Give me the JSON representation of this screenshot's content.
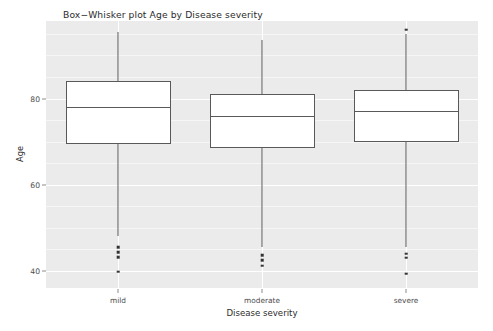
{
  "chart_data": {
    "type": "box",
    "title": "Box−Whisker plot Age by Disease severity",
    "xlabel": "Disease severity",
    "ylabel": "Age",
    "categories": [
      "mild",
      "moderate",
      "severe"
    ],
    "ylim": [
      36,
      98
    ],
    "yticks": [
      80,
      60,
      40
    ],
    "ytick_labels": [
      "80",
      "60",
      "40"
    ],
    "grid": true,
    "grid_color": "#ffffff",
    "panel_background": "#ebebeb",
    "legend": null,
    "box_fill": "#ffffff",
    "box_line_color": "#595959",
    "boxes": [
      {
        "category": "mild",
        "whisker_low": 48.0,
        "q1": 69.5,
        "median": 78.0,
        "q3": 84.0,
        "whisker_high": 95.5,
        "outliers": [
          45.5,
          44.3,
          43.1,
          39.8
        ]
      },
      {
        "category": "moderate",
        "whisker_low": 45.5,
        "q1": 68.5,
        "median": 76.0,
        "q3": 81.0,
        "whisker_high": 93.5,
        "outliers": [
          43.6,
          42.4,
          41.2
        ]
      },
      {
        "category": "severe",
        "whisker_low": 45.5,
        "q1": 70.0,
        "median": 77.0,
        "q3": 82.0,
        "whisker_high": 95.0,
        "outliers": [
          96.0,
          44.0,
          43.0,
          39.3
        ]
      }
    ]
  },
  "axis": {
    "y_title": "Age",
    "x_title": "Disease severity"
  }
}
